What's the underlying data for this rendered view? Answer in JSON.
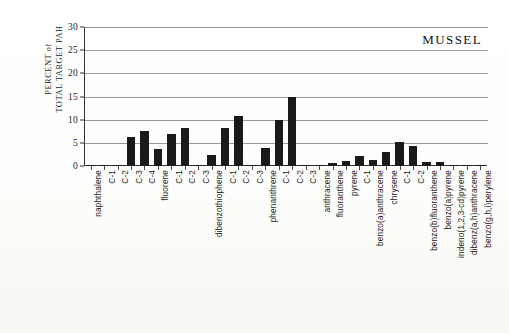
{
  "chart_data": {
    "type": "bar",
    "title": "MUSSEL",
    "xlabel": "",
    "ylabel": "PERCENT of TOTAL TARGET PAH",
    "ylabel_lines": [
      "PERCENT of",
      "TOTAL TARGET PAH"
    ],
    "ylim": [
      0,
      30
    ],
    "ytick_values": [
      0,
      5,
      10,
      15,
      20,
      25,
      30
    ],
    "ytick_labels": [
      "0",
      "5",
      "10",
      "15",
      "20",
      "25",
      "30"
    ],
    "grid": true,
    "grid_orientation": "horizontal",
    "legend": false,
    "bar_color": "#1a1a1a",
    "background_color": "#ffffff",
    "categories": [
      "naphthalene",
      "C-1",
      "C-2",
      "C-3",
      "C-4",
      "fluorene",
      "C-1",
      "C-2",
      "C-3",
      "dibenzothiophene",
      "C-1",
      "C-2",
      "C-3",
      "phenanthrene",
      "C-1",
      "C-2",
      "C-3",
      "anthracene",
      "fluoranthene",
      "pyrene",
      "C-1",
      "benzo(a)anthracene",
      "chrysene",
      "C-1",
      "C-2",
      "benzo(b)fluoranthene",
      "benzo(a)pyrene",
      "indeno(1,2,3-cd)pyrene",
      "dibenz(a,h)anthracene",
      "benzo(g,h,i)perylene"
    ],
    "values": [
      0.1,
      0.1,
      0.2,
      6.3,
      7.6,
      3.7,
      6.9,
      8.3,
      0.2,
      2.3,
      8.3,
      10.8,
      0.2,
      3.8,
      10.0,
      15.0,
      0.2,
      0.3,
      0.6,
      1.0,
      2.2,
      1.3,
      3.0,
      5.1,
      4.3,
      0.9,
      0.9,
      0.1,
      0.1,
      0.3
    ]
  }
}
